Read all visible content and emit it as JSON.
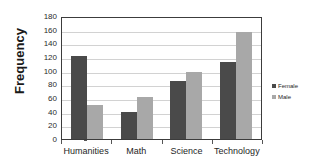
{
  "chart_data": {
    "type": "bar",
    "title": "",
    "xlabel": "",
    "ylabel": "Frequency",
    "categories": [
      "Humanities",
      "Math",
      "Science",
      "Technology"
    ],
    "series": [
      {
        "name": "Female",
        "color": "#4a4a4a",
        "values": [
          122,
          39,
          85,
          112
        ]
      },
      {
        "name": "Male",
        "color": "#a8a8a8",
        "values": [
          50,
          62,
          98,
          156
        ]
      }
    ],
    "ylim": [
      0,
      180
    ],
    "ytick_step": 20,
    "yticks": [
      180,
      160,
      140,
      120,
      100,
      80,
      60,
      40,
      20,
      0
    ],
    "grid": true,
    "legend_position": "right"
  },
  "legend": {
    "items": [
      {
        "label": "Female",
        "marker": "square-dark-icon"
      },
      {
        "label": "Male",
        "marker": "square-gray-icon"
      }
    ]
  }
}
